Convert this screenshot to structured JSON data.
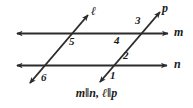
{
  "figure": {
    "background_color": "#ffffff",
    "stroke_color": "#2b2b2b",
    "caption": "m‖n, ℓ‖p"
  },
  "lines": [
    {
      "id": "m",
      "label": "m",
      "kind": "horizontal",
      "x1": 17,
      "y1": 33,
      "x2": 168,
      "y2": 33,
      "arrows": "both",
      "label_x": 174,
      "label_y": 27
    },
    {
      "id": "n",
      "label": "n",
      "kind": "horizontal",
      "x1": 17,
      "y1": 65,
      "x2": 167,
      "y2": 65,
      "arrows": "both",
      "label_x": 174,
      "label_y": 59
    },
    {
      "id": "l",
      "label": "ℓ",
      "kind": "transversal",
      "x1": 30,
      "y1": 83,
      "x2": 88,
      "y2": 15,
      "arrows": "both",
      "label_x": 92,
      "label_y": 6
    },
    {
      "id": "p",
      "label": "p",
      "kind": "transversal",
      "x1": 100,
      "y1": 82,
      "x2": 160,
      "y2": 12,
      "arrows": "both",
      "label_x": 163,
      "label_y": 3
    }
  ],
  "angles": [
    {
      "id": "1",
      "label": "1",
      "x": 110,
      "y": 70,
      "at": "p-meets-n",
      "position": "below-right"
    },
    {
      "id": "2",
      "label": "2",
      "x": 123,
      "y": 50,
      "at": "p-meets-n",
      "position": "above-right"
    },
    {
      "id": "3",
      "label": "3",
      "x": 135,
      "y": 15,
      "at": "p-meets-m",
      "position": "above-left"
    },
    {
      "id": "4",
      "label": "4",
      "x": 114,
      "y": 35,
      "at": "p-meets-m",
      "position": "below-left"
    },
    {
      "id": "5",
      "label": "5",
      "x": 69,
      "y": 36,
      "at": "l-meets-m",
      "position": "below-right"
    },
    {
      "id": "6",
      "label": "6",
      "x": 41,
      "y": 72,
      "at": "l-meets-n",
      "position": "below-right"
    }
  ]
}
